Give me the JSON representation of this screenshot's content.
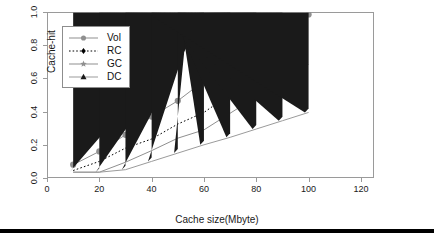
{
  "chart_data": {
    "type": "line",
    "title": "",
    "subtitle": "",
    "xlabel": "Cache size(Mbyte)",
    "ylabel": "Cache-hit",
    "x": [
      10,
      20,
      30,
      40,
      50,
      60,
      70,
      80,
      90,
      100
    ],
    "xlim": [
      0,
      125
    ],
    "ylim": [
      0,
      1.0
    ],
    "xticks": [
      0,
      20,
      40,
      60,
      80,
      100,
      120
    ],
    "xtick_labels": [
      "0",
      "20",
      "40",
      "60",
      "80",
      "100",
      "120"
    ],
    "yticks": [
      0.0,
      0.2,
      0.4,
      0.6,
      0.8,
      1.0
    ],
    "ytick_labels": [
      "0.0",
      "0.2",
      "0.4",
      "0.6",
      "0.8",
      "1.0"
    ],
    "grid": false,
    "legend_position": "top-left",
    "series": [
      {
        "name": "Vol",
        "values": [
          0.08,
          0.16,
          0.26,
          0.37,
          0.465,
          0.585,
          0.69,
          0.795,
          0.89,
          0.985
        ],
        "color": "#8f8f8f",
        "marker": "circle",
        "linestyle": "solid"
      },
      {
        "name": "RC",
        "values": [
          0.045,
          0.1,
          0.18,
          0.235,
          0.325,
          0.395,
          0.505,
          0.62,
          0.685,
          0.8
        ],
        "color": "#000000",
        "marker": "diamond",
        "linestyle": "dotted"
      },
      {
        "name": "GC",
        "values": [
          0.035,
          0.035,
          0.095,
          0.165,
          0.24,
          0.29,
          0.39,
          0.49,
          0.615,
          0.685
        ],
        "color": "#8f8f8f",
        "marker": "star",
        "linestyle": "solid"
      },
      {
        "name": "DC",
        "values": [
          0.035,
          0.035,
          0.05,
          0.1,
          0.15,
          0.2,
          0.245,
          0.295,
          0.345,
          0.395
        ],
        "color": "#1a1a1a",
        "marker": "triangle",
        "linestyle": "solid"
      }
    ]
  },
  "legend": {
    "entries": [
      "Vol",
      "RC",
      "GC",
      "DC"
    ]
  },
  "axes": {
    "x_title": "Cache size(Mbyte)",
    "y_title": "Cache-hit"
  }
}
